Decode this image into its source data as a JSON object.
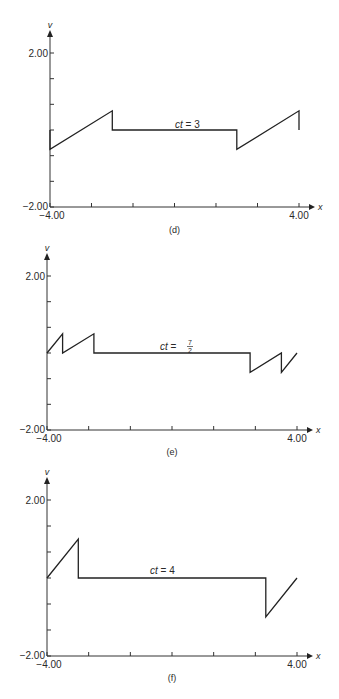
{
  "chart_data": [
    {
      "type": "line",
      "panel": "(d)",
      "annotation": {
        "lhs": "ct",
        "rhs": "3"
      },
      "xlabel": "x",
      "ylabel": "v",
      "xlim": [
        -4.0,
        4.0
      ],
      "ylim": [
        -2.0,
        2.0
      ],
      "x_tick_labels": [
        "-4.00",
        "4.00"
      ],
      "y_tick_labels": [
        "2.00",
        "-2.00"
      ],
      "x_ticks": [
        -4.0,
        -2.667,
        -1.333,
        0.0,
        1.333,
        2.667,
        4.0
      ],
      "y_ticks": [
        2.0,
        1.333,
        0.667,
        0.0,
        -0.667,
        -1.333,
        -2.0
      ],
      "grid": false,
      "series": [
        {
          "name": "v",
          "points": [
            [
              -4.0,
              0.0
            ],
            [
              -4.0,
              -0.5
            ],
            [
              -2.0,
              0.5
            ],
            [
              -2.0,
              0.0
            ],
            [
              2.0,
              0.0
            ],
            [
              2.0,
              -0.5
            ],
            [
              4.0,
              0.5
            ],
            [
              4.0,
              0.0
            ]
          ]
        }
      ]
    },
    {
      "type": "line",
      "panel": "(e)",
      "annotation": {
        "lhs": "ct",
        "num": "7",
        "den": "2"
      },
      "xlabel": "x",
      "ylabel": "v",
      "xlim": [
        -4.0,
        4.0
      ],
      "ylim": [
        -2.0,
        2.0
      ],
      "x_tick_labels": [
        "-4.00",
        "4.00"
      ],
      "y_tick_labels": [
        "2.00",
        "-2.00"
      ],
      "x_ticks": [
        -4.0,
        -2.667,
        -1.333,
        0.0,
        1.333,
        2.667,
        4.0
      ],
      "y_ticks": [
        2.0,
        1.333,
        0.667,
        0.0,
        -0.667,
        -1.333,
        -2.0
      ],
      "grid": false,
      "series": [
        {
          "name": "v",
          "points": [
            [
              -4.0,
              0.0
            ],
            [
              -3.5,
              0.5
            ],
            [
              -3.5,
              0.0
            ],
            [
              -2.5,
              0.5
            ],
            [
              -2.5,
              0.0
            ],
            [
              2.5,
              0.0
            ],
            [
              2.5,
              -0.5
            ],
            [
              3.5,
              0.0
            ],
            [
              3.5,
              -0.5
            ],
            [
              4.0,
              0.0
            ]
          ]
        }
      ]
    },
    {
      "type": "line",
      "panel": "(f)",
      "annotation": {
        "lhs": "ct",
        "rhs": "4"
      },
      "xlabel": "x",
      "ylabel": "v",
      "xlim": [
        -4.0,
        4.0
      ],
      "ylim": [
        -2.0,
        2.0
      ],
      "x_tick_labels": [
        "-4.00",
        "4.00"
      ],
      "y_tick_labels": [
        "2.00",
        "-2.00"
      ],
      "x_ticks": [
        -4.0,
        -2.667,
        -1.333,
        0.0,
        1.333,
        2.667,
        4.0
      ],
      "y_ticks": [
        2.0,
        1.333,
        0.667,
        0.0,
        -0.667,
        -1.333,
        -2.0
      ],
      "grid": false,
      "series": [
        {
          "name": "v",
          "points": [
            [
              -4.0,
              0.0
            ],
            [
              -3.0,
              1.0
            ],
            [
              -3.0,
              0.0
            ],
            [
              3.0,
              0.0
            ],
            [
              3.0,
              -1.0
            ],
            [
              4.0,
              0.0
            ]
          ]
        }
      ]
    }
  ]
}
